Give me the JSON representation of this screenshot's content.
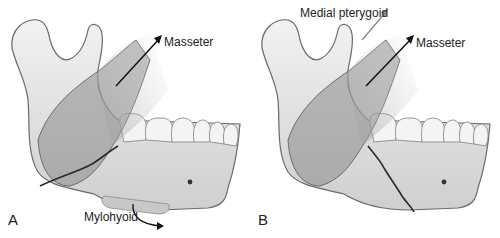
{
  "figure": {
    "colors": {
      "bone_fill": "#e4e4e4",
      "bone_stroke": "#6a6a6a",
      "muscle_fill": "#8a8a8a",
      "fracture_line": "#2a2a2a",
      "arrow_dark": "#111111",
      "arrow_light": "#888888",
      "label_text": "#222222"
    },
    "panels": [
      {
        "id": "A",
        "letter": "A",
        "labels": {
          "masseter": "Masseter",
          "mylohyoid": "Mylohyoid"
        }
      },
      {
        "id": "B",
        "letter": "B",
        "labels": {
          "medial_pterygoid": "Medial pterygoid",
          "masseter": "Masseter"
        }
      }
    ]
  }
}
